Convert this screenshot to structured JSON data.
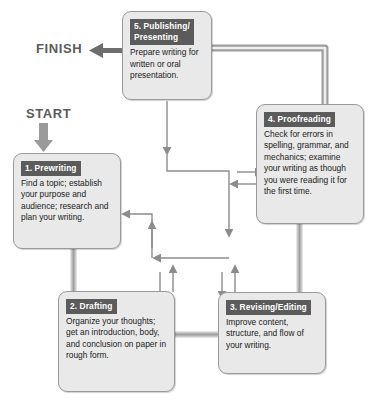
{
  "diagram": {
    "type": "cyclical-flowchart",
    "colors": {
      "header_bar": "#5b5b5b",
      "box_fill": "#e9e9e9",
      "box_border": "#9a9a9a",
      "arrow": "#8c8c8c",
      "pipe": "#b8b8b8",
      "label_text": "#5b5b5b",
      "body_text": "#1a1a1a",
      "header_text": "#ffffff"
    }
  },
  "labels": {
    "start": "START",
    "finish": "FINISH"
  },
  "steps": [
    {
      "id": "step-5",
      "number": "5.",
      "header": "5. Publishing/\nPresenting",
      "body": "Prepare writing for written or oral presentation."
    },
    {
      "id": "step-4",
      "number": "4.",
      "header": "4. Proofreading",
      "body": "Check for errors in spelling, grammar, and mechanics; examine your writing as though you were reading it for the first time."
    },
    {
      "id": "step-1",
      "number": "1.",
      "header": "1. Prewriting",
      "body": "Find a topic; establish your purpose and audience; research and plan your writing."
    },
    {
      "id": "step-2",
      "number": "2.",
      "header": "2. Drafting",
      "body": "Organize your thoughts; get an introduction, body, and conclusion on paper in rough form."
    },
    {
      "id": "step-3",
      "number": "3.",
      "header": "3. Revising/Editing",
      "body": "Improve content, structure, and flow of your writing."
    }
  ],
  "connections": {
    "sequential": [
      "start-to-step-1",
      "step-1-to-step-2",
      "step-2-to-step-3",
      "step-3-to-step-4",
      "step-4-to-step-5",
      "step-5-to-finish"
    ],
    "recursive": [
      "step-5-down-to-hub",
      "hub-to-step-4",
      "step-4-to-hub",
      "hub-to-step-1",
      "step-1-to-hub",
      "hub-to-step-2",
      "step-2-to-hub",
      "hub-to-step-3",
      "step-3-to-hub"
    ]
  }
}
